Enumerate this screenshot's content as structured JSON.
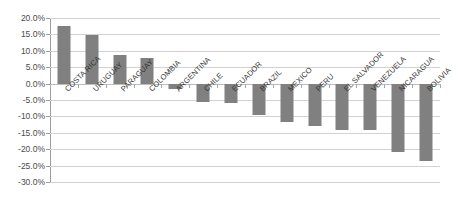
{
  "chart_data": {
    "type": "bar",
    "title": "",
    "subtitle": "",
    "xlabel": "",
    "ylabel": "",
    "ylim": [
      -30,
      20
    ],
    "ytick_step": 5,
    "grid": true,
    "legend": false,
    "orientation": "vertical",
    "bar_color": "#808080",
    "gridline_color": "#d2d2d2",
    "axis_color": "#9c9c9c",
    "value_format": "percent_one_decimal",
    "categories": [
      "COSTA RICA",
      "URUGUAY",
      "PARAGUAY",
      "COLOMBIA",
      "ARGENTINA",
      "CHILE",
      "ECUADOR",
      "BRAZIL",
      "MEXICO",
      "PERU",
      "EL SALVADOR",
      "VENEZUELA",
      "NICARAGUA",
      "BOLIVIA"
    ],
    "values": [
      17.5,
      14.8,
      8.8,
      7.7,
      -1.5,
      -5.5,
      -6.0,
      -9.5,
      -11.8,
      -13.0,
      -14.0,
      -14.3,
      -21.0,
      -23.5
    ],
    "ytick_labels": [
      "20.0%",
      "15.0%",
      "10.0%",
      "5.0%",
      "0.0%",
      "-5.0%",
      "-10.0%",
      "-15.0%",
      "-20.0%",
      "-25.0%",
      "-30.0%"
    ],
    "ytick_values": [
      20,
      15,
      10,
      5,
      0,
      -5,
      -10,
      -15,
      -20,
      -25,
      -30
    ]
  }
}
